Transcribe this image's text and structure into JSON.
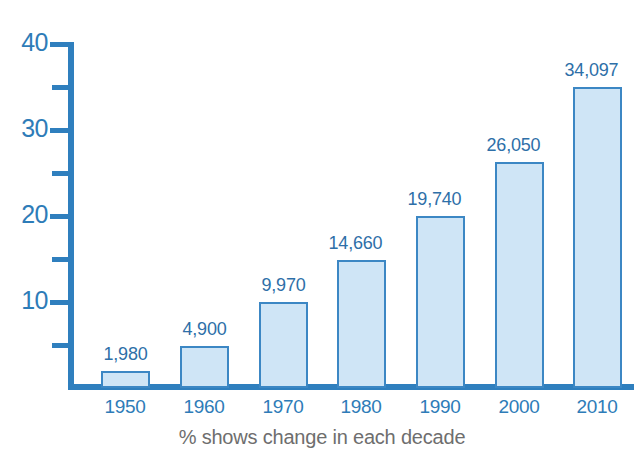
{
  "chart_data": {
    "type": "bar",
    "title": "",
    "xlabel": "",
    "ylabel": "",
    "footer_note": "% shows change in each decade",
    "categories": [
      "1950",
      "1960",
      "1970",
      "1980",
      "1990",
      "2000",
      "2010"
    ],
    "values": [
      1980,
      4900,
      9970,
      14660,
      19740,
      26050,
      34097
    ],
    "value_labels": [
      "1,980",
      "4,900",
      "9,970",
      "14,660",
      "19,740",
      "26,050",
      "34,097"
    ],
    "y_ticks_major": [
      "10",
      "20",
      "30",
      "40"
    ],
    "y_tick_values_major": [
      10,
      20,
      30,
      40
    ],
    "y_tick_values_minor": [
      5,
      15,
      25,
      35
    ],
    "ylim": [
      0,
      40
    ],
    "y_axis_scale_note": "thousands",
    "grid": false,
    "legend": "none",
    "colors": {
      "bar_fill": "#cfe5f6",
      "bar_border": "#3c87c4",
      "axis": "#2f7fbe",
      "label_text": "#2e7cb8",
      "value_text": "#2e6fa8",
      "footer_text": "#6e6e6e",
      "background": "#ffffff"
    }
  },
  "bars": [
    {
      "category": "1950",
      "value": 1980,
      "label": "1,980",
      "left": 101,
      "width": 49,
      "top": 371,
      "height": 17,
      "label_left": 85,
      "label_top": 344
    },
    {
      "category": "1960",
      "value": 4900,
      "label": "4,900",
      "left": 180,
      "width": 49,
      "top": 346,
      "height": 42,
      "label_left": 164,
      "label_top": 319
    },
    {
      "category": "1970",
      "value": 9970,
      "label": "9,970",
      "left": 259,
      "width": 49,
      "top": 302,
      "height": 86,
      "label_left": 243,
      "label_top": 275
    },
    {
      "category": "1980",
      "value": 14660,
      "label": "14,660",
      "left": 337,
      "width": 49,
      "top": 260,
      "height": 128,
      "label_left": 315,
      "label_top": 233
    },
    {
      "category": "1990",
      "value": 19740,
      "label": "19,740",
      "left": 416,
      "width": 49,
      "top": 216,
      "height": 172,
      "label_left": 394,
      "label_top": 189
    },
    {
      "category": "2000",
      "value": 26050,
      "label": "26,050",
      "left": 495,
      "width": 49,
      "top": 162,
      "height": 226,
      "label_left": 473,
      "label_top": 135
    },
    {
      "category": "2010",
      "value": 34097,
      "label": "34,097",
      "left": 573,
      "width": 49,
      "top": 87,
      "height": 301,
      "label_left": 551,
      "label_top": 60
    }
  ],
  "y_axis": [
    {
      "label": "40",
      "top": 42,
      "kind": "major",
      "text_top": 28
    },
    {
      "label": "",
      "top": 85,
      "kind": "minor"
    },
    {
      "label": "30",
      "top": 128,
      "kind": "major",
      "text_top": 114
    },
    {
      "label": "",
      "top": 171,
      "kind": "minor"
    },
    {
      "label": "20",
      "top": 214,
      "kind": "major",
      "text_top": 200
    },
    {
      "label": "",
      "top": 257,
      "kind": "minor"
    },
    {
      "label": "10",
      "top": 300,
      "kind": "major",
      "text_top": 286
    },
    {
      "label": "",
      "top": 343,
      "kind": "minor"
    }
  ],
  "x_axis": [
    {
      "label": "1950",
      "center": 125
    },
    {
      "label": "1960",
      "center": 204
    },
    {
      "label": "1970",
      "center": 283
    },
    {
      "label": "1980",
      "center": 361
    },
    {
      "label": "1990",
      "center": 440
    },
    {
      "label": "2000",
      "center": 519
    },
    {
      "label": "2010",
      "center": 597
    }
  ]
}
